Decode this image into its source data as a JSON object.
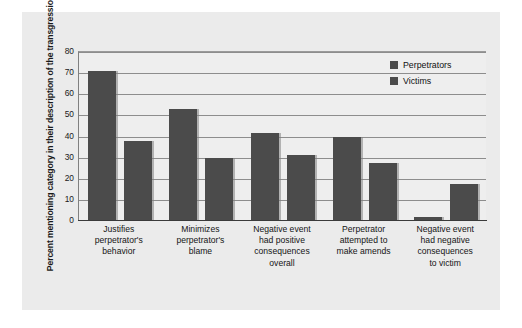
{
  "chart_data": {
    "type": "bar",
    "title": "",
    "xlabel": "",
    "ylabel": "Percent mentioning category in their description of the transgression",
    "ylim": [
      0,
      80
    ],
    "yticks": [
      0,
      10,
      20,
      30,
      40,
      50,
      60,
      70,
      80
    ],
    "grid": true,
    "legend_position": "top-right",
    "categories": [
      "Justifies perpetrator's behavior",
      "Minimizes perpetrator's blame",
      "Negative event had positive consequences overall",
      "Perpetrator attempted to make amends",
      "Negative event had negative consequences to victim"
    ],
    "category_lines": [
      [
        "Justifies",
        "perpetrator's",
        "behavior"
      ],
      [
        "Minimizes",
        "perpetrator's",
        "blame"
      ],
      [
        "Negative event",
        "had positive",
        "consequences",
        "overall"
      ],
      [
        "Perpetrator",
        "attempted to",
        "make amends"
      ],
      [
        "Negative event",
        "had negative",
        "consequences",
        "to victim"
      ]
    ],
    "series": [
      {
        "name": "Perpetrators",
        "color": "#4b4b4b",
        "values": [
          70.5,
          52.5,
          41,
          39.5,
          1.5
        ]
      },
      {
        "name": "Victims",
        "color": "#4b4b4b",
        "values": [
          37.5,
          29.5,
          31,
          27,
          17
        ]
      }
    ]
  },
  "legend": {
    "items": [
      {
        "label": "Perpetrators",
        "swatch": "legend-swatch-perpetrators"
      },
      {
        "label": "Victims",
        "swatch": "legend-swatch-victims"
      }
    ]
  },
  "colors": {
    "bar": "#4b4b4b",
    "panel_background": "#ebebeb",
    "plot_background": "#eeeeee",
    "gridline": "#8d8d8d",
    "axis": "#3a3a3a",
    "text": "#151515"
  }
}
